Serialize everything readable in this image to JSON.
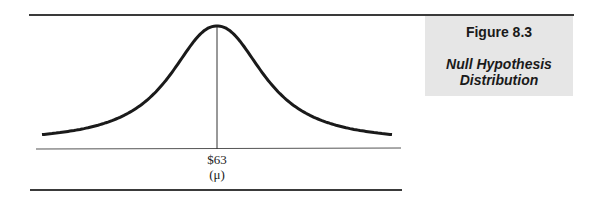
{
  "caption": {
    "figure_number": "Figure 8.3",
    "title": "Null Hypothesis Distribution"
  },
  "axis": {
    "mean_value_label": "$63",
    "mean_symbol_label": "(μ)"
  },
  "chart_data": {
    "type": "line",
    "title": "Null Hypothesis Distribution",
    "xlabel": "",
    "ylabel": "",
    "x_tick_labels": [
      "$63 (μ)"
    ],
    "center": 63,
    "series": [
      {
        "name": "null distribution",
        "shape": "normal",
        "mean": 63
      }
    ],
    "annotations": [
      {
        "type": "vertical_line",
        "x": 63,
        "label": "$63 (μ)"
      }
    ],
    "grid": false,
    "legend": null
  },
  "colors": {
    "curve": "#1a1a1a",
    "caption_bg": "#e6e6e6",
    "rules": "#3a3a3a"
  }
}
